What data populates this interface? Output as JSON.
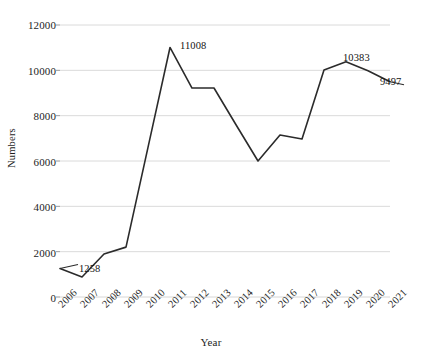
{
  "chart_data": {
    "type": "line",
    "title": "",
    "xlabel": "Year",
    "ylabel": "Numbers",
    "categories": [
      "2006",
      "2007",
      "2008",
      "2009",
      "2010",
      "2011",
      "2012",
      "2013",
      "2014",
      "2015",
      "2016",
      "2017",
      "2018",
      "2019",
      "2020",
      "2021"
    ],
    "values": [
      1258,
      880,
      1900,
      2200,
      6600,
      11008,
      9220,
      9220,
      7600,
      6000,
      7150,
      6970,
      10010,
      10383,
      9980,
      9497
    ],
    "series": [
      {
        "name": "Numbers",
        "values": [
          1258,
          880,
          1900,
          2200,
          6600,
          11008,
          9220,
          9220,
          7600,
          6000,
          7150,
          6970,
          10010,
          10383,
          9980,
          9497
        ]
      }
    ],
    "yticks": [
      0,
      2000,
      4000,
      6000,
      8000,
      10000,
      12000
    ],
    "ytick_labels": [
      "0",
      "2000",
      "4000",
      "6000",
      "8000",
      "10000",
      "12000"
    ],
    "ylim": [
      0,
      12000
    ],
    "grid": "horizontal",
    "legend": "none",
    "line_color": "#2b2b2b",
    "grid_color": "#d6d6d6",
    "annotations": [
      {
        "label": "1258",
        "category": "2006",
        "value": 1258
      },
      {
        "label": "11008",
        "category": "2011",
        "value": 11008
      },
      {
        "label": "10383",
        "category": "2019",
        "value": 10383
      },
      {
        "label": "9497",
        "category": "2021",
        "value": 9497
      }
    ]
  },
  "axis": {
    "y_title": "Numbers",
    "x_title": "Year",
    "y_labels": [
      "12000",
      "10000",
      "8000",
      "6000",
      "4000",
      "2000",
      "0"
    ],
    "x_labels": [
      "2006",
      "2007",
      "2008",
      "2009",
      "2010",
      "2011",
      "2012",
      "2013",
      "2014",
      "2015",
      "2016",
      "2017",
      "2018",
      "2019",
      "2020",
      "2021"
    ]
  },
  "annotations": {
    "first": "1258",
    "peak": "11008",
    "late_peak": "10383",
    "last": "9497"
  }
}
